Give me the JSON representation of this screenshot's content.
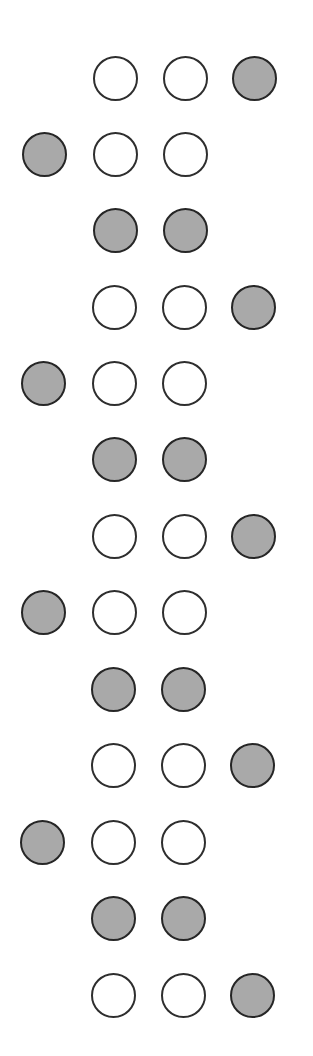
{
  "diagram": {
    "type": "dot-pattern-sequence",
    "colors": {
      "filled": "#a9a9a9",
      "empty": "#ffffff",
      "stroke": "#2e2e2e",
      "background": "#ffffff"
    },
    "columns_x": [
      44,
      115,
      185,
      254
    ],
    "diameter": 45,
    "rows": [
      {
        "y": 78,
        "cells": [
          "none",
          "empty",
          "empty",
          "filled"
        ]
      },
      {
        "y": 154,
        "cells": [
          "filled",
          "empty",
          "empty",
          "none"
        ]
      },
      {
        "y": 230,
        "cells": [
          "none",
          "filled",
          "filled",
          "none"
        ]
      },
      {
        "y": 307,
        "cells": [
          "none",
          "empty",
          "empty",
          "filled"
        ]
      },
      {
        "y": 383,
        "cells": [
          "filled",
          "empty",
          "empty",
          "none"
        ]
      },
      {
        "y": 459,
        "cells": [
          "none",
          "filled",
          "filled",
          "none"
        ]
      },
      {
        "y": 536,
        "cells": [
          "none",
          "empty",
          "empty",
          "filled"
        ]
      },
      {
        "y": 612,
        "cells": [
          "filled",
          "empty",
          "empty",
          "none"
        ]
      },
      {
        "y": 689,
        "cells": [
          "none",
          "filled",
          "filled",
          "none"
        ]
      },
      {
        "y": 765,
        "cells": [
          "none",
          "empty",
          "empty",
          "filled"
        ]
      },
      {
        "y": 842,
        "cells": [
          "filled",
          "empty",
          "empty",
          "none"
        ]
      },
      {
        "y": 918,
        "cells": [
          "none",
          "filled",
          "filled",
          "none"
        ]
      },
      {
        "y": 995,
        "cells": [
          "none",
          "empty",
          "empty",
          "filled"
        ]
      }
    ]
  }
}
